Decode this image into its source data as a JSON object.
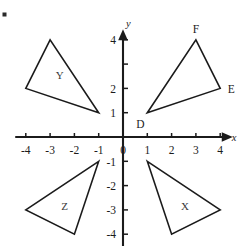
{
  "figure": {
    "corner_mark": "•"
  },
  "chart_data": {
    "type": "scatter",
    "title": "",
    "xlabel": "x",
    "ylabel": "y",
    "xlim": [
      -4.6,
      4.6
    ],
    "ylim": [
      -4.6,
      4.6
    ],
    "grid": false,
    "legend": "none",
    "x_tick_labels": [
      "-4",
      "-3",
      "-2",
      "-1",
      "0",
      "1",
      "2",
      "3",
      "4"
    ],
    "x_tick_values": [
      -4,
      -3,
      -2,
      -1,
      0,
      1,
      2,
      3,
      4
    ],
    "y_tick_labels": [
      "4",
      "2",
      "1",
      "-1",
      "-2",
      "-3",
      "-4"
    ],
    "y_tick_values": [
      4,
      2,
      1,
      -1,
      -2,
      -3,
      -4
    ],
    "y_tick_positions_unlabeled": [
      3
    ],
    "origin_label": "0",
    "shapes": [
      {
        "name": "triangle-def",
        "label": "",
        "quadrant": 1,
        "vertices": [
          {
            "label": "D",
            "x": 1,
            "y": 1,
            "label_pos": "below-left"
          },
          {
            "label": "F",
            "x": 3,
            "y": 4,
            "label_pos": "above"
          },
          {
            "label": "E",
            "x": 4,
            "y": 2,
            "label_pos": "right"
          }
        ]
      },
      {
        "name": "triangle-y",
        "label": "Y",
        "quadrant": 2,
        "label_x": -2.6,
        "label_y": 2.55,
        "vertices": [
          {
            "label": "",
            "x": -3,
            "y": 4
          },
          {
            "label": "",
            "x": -4,
            "y": 2
          },
          {
            "label": "",
            "x": -1,
            "y": 1
          }
        ]
      },
      {
        "name": "triangle-z",
        "label": "Z",
        "quadrant": 3,
        "label_x": -2.4,
        "label_y": -2.85,
        "vertices": [
          {
            "label": "",
            "x": -1,
            "y": -1
          },
          {
            "label": "",
            "x": -4,
            "y": -3
          },
          {
            "label": "",
            "x": -2,
            "y": -4
          }
        ]
      },
      {
        "name": "triangle-x",
        "label": "X",
        "quadrant": 4,
        "label_x": 2.55,
        "label_y": -2.85,
        "vertices": [
          {
            "label": "",
            "x": 1,
            "y": -1
          },
          {
            "label": "",
            "x": 4,
            "y": -3
          },
          {
            "label": "",
            "x": 2,
            "y": -4
          }
        ]
      }
    ],
    "colors": {
      "axis": "#1b1b1b",
      "shape_stroke": "#1b1b1b",
      "shape_label": "#3a3a3a",
      "background": "#ffffff"
    }
  }
}
